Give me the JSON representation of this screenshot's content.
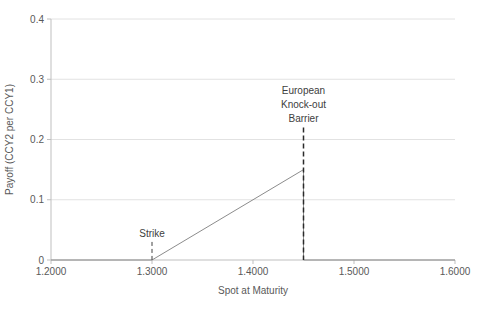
{
  "chart_data": {
    "type": "line",
    "title": "",
    "xlabel": "Spot at Maturity",
    "ylabel": "Payoff (CCY2 per CCY1)",
    "xlim": [
      1.2,
      1.6
    ],
    "ylim": [
      0,
      0.4
    ],
    "x_tick_labels": [
      "1.2000",
      "1.3000",
      "1.4000",
      "1.5000",
      "1.6000"
    ],
    "x_tick_values": [
      1.2,
      1.3,
      1.4,
      1.5,
      1.6
    ],
    "y_tick_labels": [
      "0",
      "0.1",
      "0.2",
      "0.3",
      "0.4"
    ],
    "y_tick_values": [
      0,
      0.1,
      0.2,
      0.3,
      0.4
    ],
    "grid": "horizontal",
    "legend": "none",
    "series": [
      {
        "name": "knockout-call-payoff",
        "color": "#8c8c8c",
        "points": [
          [
            1.2,
            0
          ],
          [
            1.3,
            0
          ],
          [
            1.45,
            0.15
          ],
          [
            1.45,
            0
          ],
          [
            1.6,
            0
          ]
        ]
      }
    ],
    "annotations": [
      {
        "name": "strike",
        "label_lines": [
          "Strike"
        ],
        "x": 1.3,
        "line_y_top": 0.03,
        "line_color": "#404040",
        "dash": "4,3",
        "line_width": 1
      },
      {
        "name": "barrier",
        "label_lines": [
          "European",
          "Knock-out",
          "Barrier"
        ],
        "x": 1.45,
        "line_y_top": 0.22,
        "line_color": "#2b2b2b",
        "dash": "5,3",
        "line_width": 1.5
      }
    ],
    "colors": {
      "background": "#ffffff",
      "gridline": "#e2e2e2",
      "axis": "#bfbfbf",
      "tick_text": "#595959",
      "annotation_text": "#404040"
    }
  }
}
